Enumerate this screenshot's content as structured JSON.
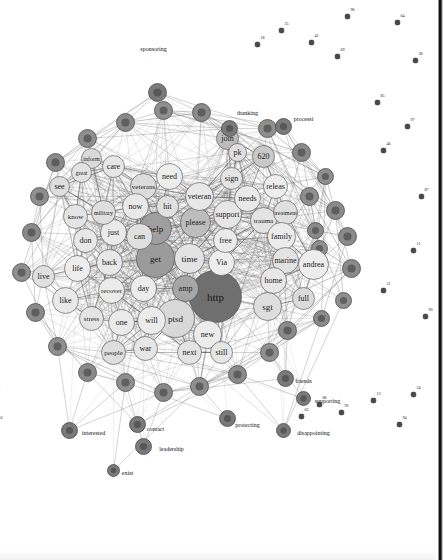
{
  "figure": {
    "type": "network-graph",
    "title": "",
    "background_color": "#ffffff",
    "border_color": "#101010",
    "orientation_degrees": 90
  },
  "chart_data": {
    "type": "scatter",
    "title": "",
    "xlabel": "",
    "ylabel": "",
    "legend": [],
    "grid": false,
    "core_nodes": [
      {
        "label": "http",
        "x": 296,
        "y": 228,
        "r": 26,
        "fill": "#6f6f6f",
        "fs": 11
      },
      {
        "label": "ptsd",
        "x": 318,
        "y": 268,
        "r": 19,
        "fill": "#d8d8d8",
        "fs": 9
      },
      {
        "label": "get",
        "x": 258,
        "y": 288,
        "r": 19,
        "fill": "#9b9b9b",
        "fs": 9
      },
      {
        "label": "help",
        "x": 228,
        "y": 288,
        "r": 16,
        "fill": "#9f9f9f",
        "fs": 9
      },
      {
        "label": "amp",
        "x": 288,
        "y": 258,
        "r": 13,
        "fill": "#a6a6a6",
        "fs": 8
      },
      {
        "label": "time",
        "x": 258,
        "y": 254,
        "r": 15,
        "fill": "#e3e3e3",
        "fs": 9
      },
      {
        "label": "Via",
        "x": 262,
        "y": 222,
        "r": 13,
        "fill": "#ededed",
        "fs": 8
      },
      {
        "label": "please",
        "x": 222,
        "y": 248,
        "r": 15,
        "fill": "#bdbdbd",
        "fs": 8
      },
      {
        "label": "support",
        "x": 214,
        "y": 216,
        "r": 14,
        "fill": "#e6e6e6",
        "fs": 8
      },
      {
        "label": "free",
        "x": 240,
        "y": 218,
        "r": 12,
        "fill": "#ebebeb",
        "fs": 8
      },
      {
        "label": "veteran",
        "x": 196,
        "y": 244,
        "r": 14,
        "fill": "#e8e8e8",
        "fs": 8
      },
      {
        "label": "hit",
        "x": 206,
        "y": 276,
        "r": 11,
        "fill": "#e0e0e0",
        "fs": 8
      },
      {
        "label": "need",
        "x": 176,
        "y": 274,
        "r": 13,
        "fill": "#ededed",
        "fs": 8
      },
      {
        "label": "veterans",
        "x": 186,
        "y": 300,
        "r": 13,
        "fill": "#dcdcdc",
        "fs": 7
      },
      {
        "label": "needs",
        "x": 198,
        "y": 196,
        "r": 13,
        "fill": "#e9e9e9",
        "fs": 8
      },
      {
        "label": "sign",
        "x": 178,
        "y": 212,
        "r": 11,
        "fill": "#e4e4e4",
        "fs": 8
      },
      {
        "label": "releas",
        "x": 186,
        "y": 168,
        "r": 12,
        "fill": "#ededed",
        "fs": 8
      },
      {
        "label": "620",
        "x": 156,
        "y": 180,
        "r": 11,
        "fill": "#c9c9c9",
        "fs": 8
      },
      {
        "label": "join",
        "x": 138,
        "y": 216,
        "r": 11,
        "fill": "#bcbcbc",
        "fs": 8
      },
      {
        "label": "pk",
        "x": 152,
        "y": 206,
        "r": 9,
        "fill": "#dedede",
        "fs": 8
      },
      {
        "label": "trauma",
        "x": 220,
        "y": 180,
        "r": 13,
        "fill": "#e3e3e3",
        "fs": 7
      },
      {
        "label": "treatment",
        "x": 212,
        "y": 158,
        "r": 12,
        "fill": "#e0e0e0",
        "fs": 6
      },
      {
        "label": "family",
        "x": 236,
        "y": 162,
        "r": 14,
        "fill": "#ececec",
        "fs": 8
      },
      {
        "label": "marine",
        "x": 260,
        "y": 158,
        "r": 13,
        "fill": "#e2e2e2",
        "fs": 8
      },
      {
        "label": "home",
        "x": 280,
        "y": 170,
        "r": 13,
        "fill": "#e7e7e7",
        "fs": 8
      },
      {
        "label": "andrea",
        "x": 264,
        "y": 130,
        "r": 15,
        "fill": "#ededed",
        "fs": 8
      },
      {
        "label": "sgt",
        "x": 306,
        "y": 176,
        "r": 14,
        "fill": "#dedede",
        "fs": 9
      },
      {
        "label": "full",
        "x": 298,
        "y": 140,
        "r": 11,
        "fill": "#dbdbdb",
        "fs": 8
      },
      {
        "label": "new",
        "x": 334,
        "y": 236,
        "r": 14,
        "fill": "#ececec",
        "fs": 8
      },
      {
        "label": "still",
        "x": 352,
        "y": 222,
        "r": 11,
        "fill": "#e6e6e6",
        "fs": 8
      },
      {
        "label": "next",
        "x": 352,
        "y": 254,
        "r": 12,
        "fill": "#e3e3e3",
        "fs": 8
      },
      {
        "label": "will",
        "x": 320,
        "y": 292,
        "r": 14,
        "fill": "#ebebeb",
        "fs": 8
      },
      {
        "label": "war",
        "x": 348,
        "y": 298,
        "r": 12,
        "fill": "#e6e6e6",
        "fs": 8
      },
      {
        "label": "one",
        "x": 322,
        "y": 322,
        "r": 13,
        "fill": "#eaeaea",
        "fs": 8
      },
      {
        "label": "people",
        "x": 352,
        "y": 330,
        "r": 12,
        "fill": "#dedede",
        "fs": 7
      },
      {
        "label": "day",
        "x": 288,
        "y": 300,
        "r": 13,
        "fill": "#ececec",
        "fs": 8
      },
      {
        "label": "recover",
        "x": 290,
        "y": 332,
        "r": 13,
        "fill": "#ebebeb",
        "fs": 7
      },
      {
        "label": "stress",
        "x": 318,
        "y": 352,
        "r": 12,
        "fill": "#e4e4e4",
        "fs": 7
      },
      {
        "label": "back",
        "x": 262,
        "y": 334,
        "r": 13,
        "fill": "#e8e8e8",
        "fs": 8
      },
      {
        "label": "just",
        "x": 232,
        "y": 330,
        "r": 13,
        "fill": "#eaeaea",
        "fs": 8
      },
      {
        "label": "can",
        "x": 236,
        "y": 304,
        "r": 13,
        "fill": "#e0e0e0",
        "fs": 8
      },
      {
        "label": "now",
        "x": 206,
        "y": 308,
        "r": 13,
        "fill": "#e9e9e9",
        "fs": 8
      },
      {
        "label": "military",
        "x": 212,
        "y": 340,
        "r": 12,
        "fill": "#dfdfdf",
        "fs": 6
      },
      {
        "label": "don",
        "x": 240,
        "y": 358,
        "r": 12,
        "fill": "#e8e8e8",
        "fs": 8
      },
      {
        "label": "life",
        "x": 268,
        "y": 366,
        "r": 13,
        "fill": "#ededed",
        "fs": 8
      },
      {
        "label": "know",
        "x": 216,
        "y": 368,
        "r": 12,
        "fill": "#e4e4e4",
        "fs": 7
      },
      {
        "label": "like",
        "x": 300,
        "y": 378,
        "r": 13,
        "fill": "#e9e9e9",
        "fs": 8
      },
      {
        "label": "live",
        "x": 276,
        "y": 400,
        "r": 11,
        "fill": "#e0e0e0",
        "fs": 8
      },
      {
        "label": "see",
        "x": 186,
        "y": 384,
        "r": 10,
        "fill": "#dedede",
        "fs": 8
      },
      {
        "label": "care",
        "x": 166,
        "y": 330,
        "r": 11,
        "fill": "#e6e6e6",
        "fs": 8
      },
      {
        "label": "inform",
        "x": 158,
        "y": 352,
        "r": 10,
        "fill": "#dadada",
        "fs": 6
      },
      {
        "label": "great",
        "x": 172,
        "y": 362,
        "r": 10,
        "fill": "#e2e2e2",
        "fs": 6
      }
    ],
    "ring_nodes": [
      {
        "label": "",
        "x": 236,
        "y": 96,
        "r": 9,
        "fill": "#8a8a8a"
      },
      {
        "label": "",
        "x": 268,
        "y": 92,
        "r": 9,
        "fill": "#8a8a8a"
      },
      {
        "label": "",
        "x": 300,
        "y": 100,
        "r": 8,
        "fill": "#8f8f8f"
      },
      {
        "label": "",
        "x": 210,
        "y": 108,
        "r": 9,
        "fill": "#8a8a8a"
      },
      {
        "label": "",
        "x": 196,
        "y": 134,
        "r": 9,
        "fill": "#8f8f8f"
      },
      {
        "label": "",
        "x": 230,
        "y": 128,
        "r": 8,
        "fill": "#8a8a8a"
      },
      {
        "label": "",
        "x": 248,
        "y": 124,
        "r": 8,
        "fill": "#8f8f8f"
      },
      {
        "label": "",
        "x": 318,
        "y": 122,
        "r": 8,
        "fill": "#8a8a8a"
      },
      {
        "label": "",
        "x": 330,
        "y": 156,
        "r": 9,
        "fill": "#8a8a8a"
      },
      {
        "label": "",
        "x": 352,
        "y": 174,
        "r": 9,
        "fill": "#8f8f8f"
      },
      {
        "label": "",
        "x": 374,
        "y": 206,
        "r": 9,
        "fill": "#8a8a8a"
      },
      {
        "label": "",
        "x": 386,
        "y": 244,
        "r": 9,
        "fill": "#8f8f8f"
      },
      {
        "label": "",
        "x": 392,
        "y": 280,
        "r": 9,
        "fill": "#8a8a8a"
      },
      {
        "label": "",
        "x": 382,
        "y": 318,
        "r": 9,
        "fill": "#8f8f8f"
      },
      {
        "label": "",
        "x": 372,
        "y": 356,
        "r": 9,
        "fill": "#8a8a8a"
      },
      {
        "label": "",
        "x": 346,
        "y": 386,
        "r": 9,
        "fill": "#8f8f8f"
      },
      {
        "label": "",
        "x": 312,
        "y": 408,
        "r": 9,
        "fill": "#8a8a8a"
      },
      {
        "label": "",
        "x": 272,
        "y": 422,
        "r": 9,
        "fill": "#8f8f8f"
      },
      {
        "label": "",
        "x": 232,
        "y": 412,
        "r": 9,
        "fill": "#8a8a8a"
      },
      {
        "label": "",
        "x": 196,
        "y": 404,
        "r": 9,
        "fill": "#8f8f8f"
      },
      {
        "label": "",
        "x": 162,
        "y": 388,
        "r": 9,
        "fill": "#8a8a8a"
      },
      {
        "label": "",
        "x": 138,
        "y": 356,
        "r": 9,
        "fill": "#8f8f8f"
      },
      {
        "label": "",
        "x": 122,
        "y": 318,
        "r": 9,
        "fill": "#8a8a8a"
      },
      {
        "label": "",
        "x": 110,
        "y": 280,
        "r": 9,
        "fill": "#8f8f8f"
      },
      {
        "label": "",
        "x": 112,
        "y": 242,
        "r": 9,
        "fill": "#8a8a8a"
      },
      {
        "label": "",
        "x": 128,
        "y": 176,
        "r": 9,
        "fill": "#8f8f8f"
      },
      {
        "label": "",
        "x": 152,
        "y": 142,
        "r": 9,
        "fill": "#8a8a8a"
      },
      {
        "label": "",
        "x": 176,
        "y": 118,
        "r": 8,
        "fill": "#8f8f8f"
      }
    ],
    "labelled_peripheral_nodes": [
      {
        "label": "processi",
        "x": 126,
        "y": 160,
        "r": 8,
        "fill": "#7a7a7a",
        "lx": 118,
        "ly": 140,
        "fs": 6
      },
      {
        "label": "thanking",
        "x": 128,
        "y": 214,
        "r": 8,
        "fill": "#7a7a7a",
        "lx": 112,
        "ly": 196,
        "fs": 6
      },
      {
        "label": "sponsoring",
        "x": 92,
        "y": 286,
        "r": 9,
        "fill": "#7a7a7a",
        "lx": 48,
        "ly": 290,
        "fs": 6
      },
      {
        "label": "supporting",
        "x": 398,
        "y": 140,
        "r": 7,
        "fill": "#7a7a7a",
        "lx": 400,
        "ly": 116,
        "fs": 6
      },
      {
        "label": "disappointing",
        "x": 430,
        "y": 160,
        "r": 7,
        "fill": "#7a7a7a",
        "lx": 432,
        "ly": 130,
        "fs": 6
      },
      {
        "label": "protecting",
        "x": 418,
        "y": 216,
        "r": 8,
        "fill": "#7a7a7a",
        "lx": 424,
        "ly": 196,
        "fs": 6
      },
      {
        "label": "friends",
        "x": 378,
        "y": 158,
        "r": 8,
        "fill": "#7a7a7a",
        "lx": 380,
        "ly": 140,
        "fs": 6
      },
      {
        "label": "leadership",
        "x": 446,
        "y": 300,
        "r": 8,
        "fill": "#7a7a7a",
        "lx": 448,
        "ly": 272,
        "fs": 6
      },
      {
        "label": "contact",
        "x": 424,
        "y": 306,
        "r": 8,
        "fill": "#7a7a7a",
        "lx": 428,
        "ly": 288,
        "fs": 6
      },
      {
        "label": "exist",
        "x": 470,
        "y": 330,
        "r": 6,
        "fill": "#7a7a7a",
        "lx": 472,
        "ly": 316,
        "fs": 6
      },
      {
        "label": "interested",
        "x": 430,
        "y": 374,
        "r": 8,
        "fill": "#7a7a7a",
        "lx": 432,
        "ly": 350,
        "fs": 6
      }
    ],
    "isolated_nodes": [
      {
        "label": "38",
        "x": 60,
        "y": 28
      },
      {
        "label": "97",
        "x": 126,
        "y": 36
      },
      {
        "label": "87",
        "x": 196,
        "y": 22
      },
      {
        "label": "11",
        "x": 250,
        "y": 30
      },
      {
        "label": "90",
        "x": 316,
        "y": 18
      },
      {
        "label": "24",
        "x": 394,
        "y": 30
      },
      {
        "label": "94",
        "x": 424,
        "y": 44
      },
      {
        "label": "64",
        "x": 22,
        "y": 46
      },
      {
        "label": "85",
        "x": 102,
        "y": 66
      },
      {
        "label": "46",
        "x": 150,
        "y": 60
      },
      {
        "label": "51",
        "x": 290,
        "y": 60
      },
      {
        "label": "13",
        "x": 400,
        "y": 70
      },
      {
        "label": "96",
        "x": 16,
        "y": 96
      },
      {
        "label": "69",
        "x": 56,
        "y": 106
      },
      {
        "label": "41",
        "x": 42,
        "y": 132
      },
      {
        "label": "35",
        "x": 30,
        "y": 162
      },
      {
        "label": "92",
        "x": 412,
        "y": 102
      },
      {
        "label": "86",
        "x": 404,
        "y": 124
      },
      {
        "label": "62",
        "x": 416,
        "y": 142
      },
      {
        "label": "18",
        "x": 44,
        "y": 186
      },
      {
        "label": "39",
        "x": 18,
        "y": 490
      },
      {
        "label": "22",
        "x": 74,
        "y": 460
      },
      {
        "label": "14",
        "x": 124,
        "y": 470
      },
      {
        "label": "19",
        "x": 206,
        "y": 472
      },
      {
        "label": "12",
        "x": 106,
        "y": 506
      },
      {
        "label": "23",
        "x": 312,
        "y": 500
      },
      {
        "label": "35",
        "x": 244,
        "y": 520
      },
      {
        "label": "52",
        "x": 310,
        "y": 512
      },
      {
        "label": "88",
        "x": 344,
        "y": 498
      },
      {
        "label": "42",
        "x": 380,
        "y": 498
      },
      {
        "label": "98",
        "x": 360,
        "y": 468
      },
      {
        "label": "76",
        "x": 414,
        "y": 478
      },
      {
        "label": "66",
        "x": 424,
        "y": 448
      },
      {
        "label": "71",
        "x": 394,
        "y": 450
      },
      {
        "label": "47",
        "x": 428,
        "y": 508
      }
    ]
  }
}
